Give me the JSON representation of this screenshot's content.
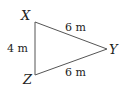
{
  "diagram": {
    "type": "triangle",
    "vertices": {
      "X": {
        "label": "X"
      },
      "Y": {
        "label": "Y"
      },
      "Z": {
        "label": "Z"
      }
    },
    "sides": {
      "XY": {
        "label": "6 m",
        "length": 6,
        "unit": "m"
      },
      "YZ": {
        "label": "6 m",
        "length": 6,
        "unit": "m"
      },
      "XZ": {
        "label": "4 m",
        "length": 4,
        "unit": "m"
      }
    },
    "colors": {
      "stroke": "#555555",
      "text": "#222222"
    }
  }
}
